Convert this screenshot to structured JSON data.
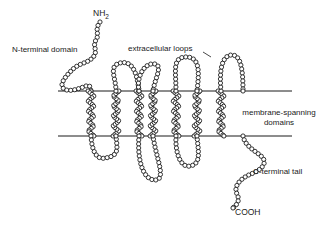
{
  "figure": {
    "type": "biological-diagram",
    "background_color": "#ffffff",
    "line_color": "#1a1a1a",
    "bead_fill": "#ffffff",
    "bead_stroke": "#141414"
  },
  "labels": {
    "n_terminus": "NH",
    "n_terminus_subscript": "2",
    "n_terminal_domain": "N-terminal domain",
    "extracellular_loops": "extracellular loops",
    "membrane_spanning": "membrane-spanning domains",
    "membrane_spanning_line1": "membrane-spanning",
    "membrane_spanning_line2": "domains",
    "c_terminal_tail": "C-terminal tail",
    "c_terminus": "COOH"
  },
  "membrane": {
    "upper_line_y": 91,
    "lower_line_y": 136,
    "x_start": 58,
    "x_end": 292,
    "stroke_width": 1
  },
  "helices": {
    "count": 7,
    "x_positions": [
      91,
      116,
      139,
      153,
      176,
      197,
      221
    ],
    "top_y": 91,
    "bottom_y": 136
  },
  "chain": {
    "bead_radius": 2.1,
    "bead_spacing": 4.0
  }
}
